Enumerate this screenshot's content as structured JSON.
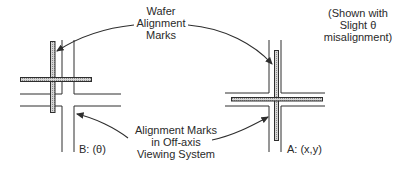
{
  "labels": {
    "wafer_marks": [
      "Wafer",
      "Alignment",
      "Marks"
    ],
    "viewing_marks": [
      "Alignment Marks",
      "in Off-axis",
      "Viewing System"
    ],
    "note": [
      "(Shown with",
      "Slight θ",
      "misalignment)"
    ],
    "system_b": "B: (θ)",
    "system_a": "A: (x,y)"
  },
  "colors": {
    "line": "#2e2e2e",
    "mark_fill": "#c8c8c8"
  }
}
